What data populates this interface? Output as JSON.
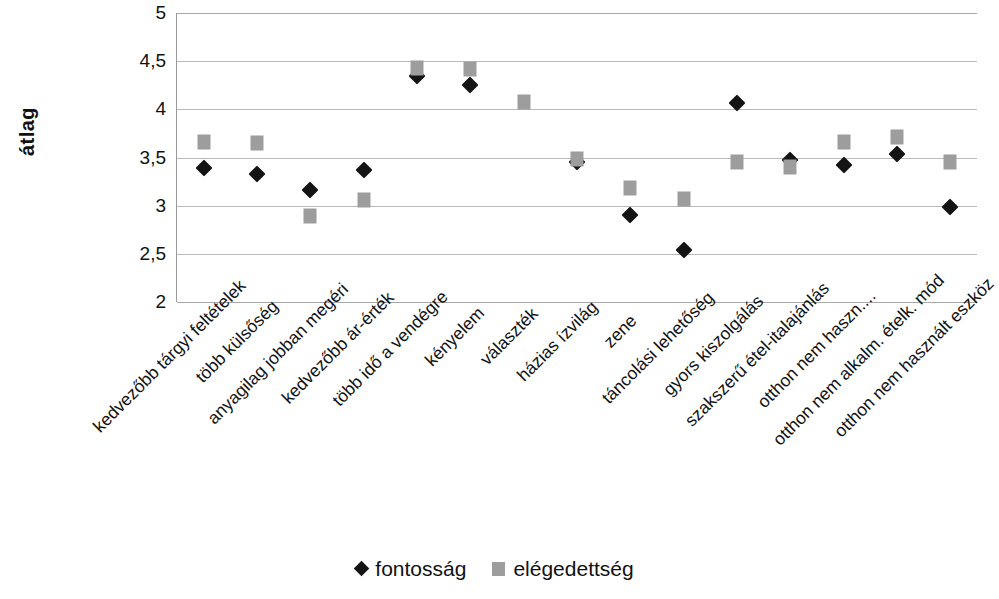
{
  "chart_data": {
    "type": "scatter",
    "title": "",
    "xlabel": "",
    "ylabel": "átlag",
    "ylim": [
      2,
      5
    ],
    "yticks": [
      "2",
      "2,5",
      "3",
      "3,5",
      "4",
      "4,5",
      "5"
    ],
    "ytick_values": [
      2,
      2.5,
      3,
      3.5,
      4,
      4.5,
      5
    ],
    "grid": true,
    "legend_position": "bottom",
    "categories": [
      "kedvezőbb tárgyi feltételek",
      "több külsőség",
      "anyagilag jobban megéri",
      "kedvezőbb ár-érték",
      "több idő a vendégre",
      "kényelem",
      "választék",
      "házias ízvilág",
      "zene",
      "táncolási lehetőség",
      "gyors kiszolgálás",
      "szakszerű étel-italajánlás",
      "otthon nem haszn....",
      "otthon nem alkalm. ételk. mód",
      "otthon nem használt eszköz"
    ],
    "series": [
      {
        "name": "fontosság",
        "marker": "diamond",
        "color": "#141414",
        "values": [
          3.39,
          3.33,
          3.16,
          3.37,
          4.35,
          4.25,
          null,
          3.45,
          2.9,
          2.54,
          4.07,
          3.47,
          3.42,
          3.54,
          2.99
        ]
      },
      {
        "name": "elégedettség",
        "marker": "square",
        "color": "#9d9d9d",
        "values": [
          3.66,
          3.65,
          2.89,
          3.06,
          4.43,
          4.42,
          4.08,
          3.48,
          3.18,
          3.07,
          3.45,
          3.4,
          3.66,
          3.71,
          3.45
        ]
      }
    ]
  },
  "legend": {
    "items": [
      {
        "label": "fontosság",
        "marker": "diamond"
      },
      {
        "label": "elégedettség",
        "marker": "square"
      }
    ]
  }
}
